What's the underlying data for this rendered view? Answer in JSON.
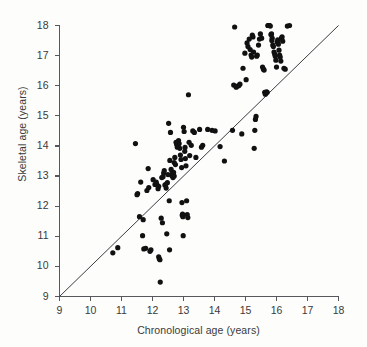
{
  "chart_data": {
    "type": "scatter",
    "title": "",
    "xlabel": "Chronological age (years)",
    "ylabel": "Skeletal age (years)",
    "xlim": [
      9,
      18
    ],
    "ylim": [
      9,
      18
    ],
    "xticks": [
      9,
      10,
      11,
      12,
      13,
      14,
      15,
      16,
      17,
      18
    ],
    "yticks": [
      9,
      10,
      11,
      12,
      13,
      14,
      15,
      16,
      17,
      18
    ],
    "xtick_labels": [
      "9",
      "10",
      "11",
      "12",
      "13",
      "14",
      "15",
      "16",
      "17",
      "18"
    ],
    "ytick_labels": [
      "9",
      "10",
      "11",
      "12",
      "13",
      "14",
      "15",
      "16",
      "17",
      "18"
    ],
    "grid": false,
    "legend": null,
    "marker": {
      "shape": "circle",
      "color": "#111111",
      "size_px": 5.2
    },
    "reference_line": {
      "name": "identity-line",
      "description": "y = x line of equality",
      "x": [
        9,
        18
      ],
      "y": [
        9,
        18
      ],
      "color": "#3c3c44",
      "width_px": 1
    },
    "axis_color": "#57575e",
    "background_color": "#fdfdfb",
    "n_points": 161,
    "points": [
      [
        10.72,
        10.45
      ],
      [
        10.88,
        10.62
      ],
      [
        11.45,
        14.08
      ],
      [
        11.52,
        12.42
      ],
      [
        11.58,
        11.65
      ],
      [
        11.62,
        12.8
      ],
      [
        11.68,
        11.02
      ],
      [
        11.7,
        11.55
      ],
      [
        11.72,
        10.58
      ],
      [
        11.78,
        10.6
      ],
      [
        11.82,
        12.52
      ],
      [
        11.86,
        13.25
      ],
      [
        11.88,
        12.62
      ],
      [
        11.92,
        10.5
      ],
      [
        11.95,
        10.55
      ],
      [
        12.02,
        12.88
      ],
      [
        12.08,
        12.72
      ],
      [
        12.12,
        12.76
      ],
      [
        12.15,
        12.7
      ],
      [
        12.18,
        12.58
      ],
      [
        12.2,
        12.66
      ],
      [
        12.2,
        10.32
      ],
      [
        12.22,
        10.25
      ],
      [
        12.24,
        10.22
      ],
      [
        12.25,
        9.48
      ],
      [
        12.28,
        11.6
      ],
      [
        12.3,
        12.95
      ],
      [
        12.32,
        11.45
      ],
      [
        12.34,
        12.98
      ],
      [
        12.36,
        13.1
      ],
      [
        12.38,
        13.18
      ],
      [
        12.4,
        12.7
      ],
      [
        12.42,
        12.72
      ],
      [
        12.44,
        12.6
      ],
      [
        12.46,
        11.08
      ],
      [
        12.48,
        12.78
      ],
      [
        12.5,
        13.05
      ],
      [
        12.52,
        14.75
      ],
      [
        12.54,
        12.18
      ],
      [
        12.55,
        10.55
      ],
      [
        12.56,
        13.52
      ],
      [
        12.58,
        14.45
      ],
      [
        12.6,
        13.22
      ],
      [
        12.62,
        13.02
      ],
      [
        12.64,
        13.08
      ],
      [
        12.66,
        12.95
      ],
      [
        12.68,
        13.12
      ],
      [
        12.7,
        13.45
      ],
      [
        12.72,
        13.62
      ],
      [
        12.74,
        13.38
      ],
      [
        12.76,
        14.12
      ],
      [
        12.78,
        14.05
      ],
      [
        12.8,
        13.96
      ],
      [
        12.82,
        14.02
      ],
      [
        12.84,
        14.18
      ],
      [
        12.86,
        14.08
      ],
      [
        12.88,
        13.92
      ],
      [
        12.9,
        13.7
      ],
      [
        12.92,
        13.55
      ],
      [
        12.94,
        13.28
      ],
      [
        12.95,
        12.12
      ],
      [
        12.96,
        11.7
      ],
      [
        12.97,
        11.74
      ],
      [
        12.98,
        11.65
      ],
      [
        12.99,
        11.02
      ],
      [
        13.0,
        14.62
      ],
      [
        13.02,
        14.48
      ],
      [
        13.04,
        13.82
      ],
      [
        13.06,
        13.58
      ],
      [
        13.08,
        13.34
      ],
      [
        13.1,
        12.18
      ],
      [
        13.12,
        11.72
      ],
      [
        13.14,
        11.62
      ],
      [
        13.16,
        15.7
      ],
      [
        13.18,
        14.12
      ],
      [
        13.2,
        13.68
      ],
      [
        13.25,
        14.02
      ],
      [
        13.3,
        14.5
      ],
      [
        13.35,
        14.45
      ],
      [
        13.4,
        13.62
      ],
      [
        13.52,
        14.55
      ],
      [
        13.58,
        13.96
      ],
      [
        13.62,
        14.02
      ],
      [
        13.78,
        14.55
      ],
      [
        13.92,
        14.52
      ],
      [
        14.02,
        14.5
      ],
      [
        14.18,
        13.98
      ],
      [
        14.32,
        13.5
      ],
      [
        14.58,
        14.52
      ],
      [
        14.62,
        16.02
      ],
      [
        14.65,
        17.95
      ],
      [
        14.72,
        15.98
      ],
      [
        14.78,
        16.0
      ],
      [
        14.82,
        16.05
      ],
      [
        14.88,
        14.4
      ],
      [
        14.92,
        16.58
      ],
      [
        14.98,
        17.08
      ],
      [
        15.02,
        16.2
      ],
      [
        15.05,
        17.42
      ],
      [
        15.08,
        17.3
      ],
      [
        15.12,
        17.55
      ],
      [
        15.18,
        17.02
      ],
      [
        15.2,
        16.95
      ],
      [
        15.22,
        17.68
      ],
      [
        15.24,
        17.62
      ],
      [
        15.26,
        17.12
      ],
      [
        15.28,
        13.92
      ],
      [
        15.3,
        14.52
      ],
      [
        15.32,
        14.88
      ],
      [
        15.34,
        14.98
      ],
      [
        15.36,
        16.98
      ],
      [
        15.38,
        17.02
      ],
      [
        15.42,
        17.35
      ],
      [
        15.45,
        17.55
      ],
      [
        15.48,
        17.72
      ],
      [
        15.52,
        17.58
      ],
      [
        15.55,
        16.62
      ],
      [
        15.58,
        16.55
      ],
      [
        15.6,
        16.52
      ],
      [
        15.62,
        15.78
      ],
      [
        15.64,
        15.72
      ],
      [
        15.66,
        15.75
      ],
      [
        15.68,
        15.8
      ],
      [
        15.7,
        15.78
      ],
      [
        15.72,
        18.0
      ],
      [
        15.74,
        18.0
      ],
      [
        15.76,
        18.0
      ],
      [
        15.78,
        18.0
      ],
      [
        15.8,
        17.98
      ],
      [
        15.82,
        17.7
      ],
      [
        15.84,
        17.72
      ],
      [
        15.86,
        17.58
      ],
      [
        15.88,
        17.35
      ],
      [
        15.9,
        17.3
      ],
      [
        15.92,
        17.12
      ],
      [
        15.94,
        17.05
      ],
      [
        15.96,
        16.98
      ],
      [
        15.98,
        16.85
      ],
      [
        16.0,
        16.62
      ],
      [
        16.02,
        17.45
      ],
      [
        16.04,
        17.52
      ],
      [
        16.06,
        17.38
      ],
      [
        16.08,
        17.18
      ],
      [
        16.1,
        17.02
      ],
      [
        16.12,
        16.95
      ],
      [
        16.14,
        16.82
      ],
      [
        16.16,
        17.58
      ],
      [
        16.18,
        17.62
      ],
      [
        16.2,
        17.48
      ],
      [
        16.24,
        16.58
      ],
      [
        16.28,
        16.55
      ],
      [
        16.35,
        17.98
      ],
      [
        16.42,
        18.0
      ],
      [
        11.5,
        12.38
      ],
      [
        12.12,
        12.8
      ],
      [
        12.8,
        14.1
      ],
      [
        15.15,
        17.2
      ],
      [
        15.85,
        17.5
      ],
      [
        12.7,
        13.0
      ],
      [
        13.05,
        13.95
      ],
      [
        14.7,
        15.95
      ]
    ]
  }
}
